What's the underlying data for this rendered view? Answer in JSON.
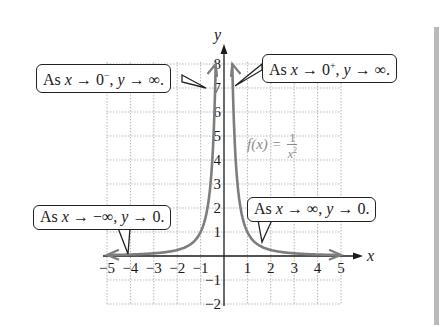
{
  "chart_data": {
    "type": "line",
    "title": "",
    "function": "f(x) = 1/x^2",
    "xlabel": "x",
    "ylabel": "y",
    "xlim": [
      -5,
      5
    ],
    "ylim": [
      -2,
      8
    ],
    "x_ticks": [
      -5,
      -4,
      -3,
      -2,
      -1,
      1,
      2,
      3,
      4,
      5
    ],
    "y_ticks": [
      -2,
      -1,
      1,
      2,
      3,
      4,
      5,
      6,
      7,
      8
    ],
    "grid": true,
    "series": [
      {
        "name": "f(x) = 1/x^2 (left branch)",
        "x": [
          -5,
          -4,
          -3,
          -2,
          -1.5,
          -1,
          -0.75,
          -0.5,
          -0.4,
          -0.354
        ],
        "y": [
          0.04,
          0.0625,
          0.111,
          0.25,
          0.444,
          1,
          1.778,
          4,
          6.25,
          8
        ]
      },
      {
        "name": "f(x) = 1/x^2 (right branch)",
        "x": [
          0.354,
          0.4,
          0.5,
          0.75,
          1,
          1.5,
          2,
          3,
          4,
          5
        ],
        "y": [
          8,
          6.25,
          4,
          1.778,
          1,
          0.444,
          0.25,
          0.111,
          0.0625,
          0.04
        ]
      }
    ],
    "annotations": [
      {
        "text": "As x → 0⁻, y → ∞.",
        "points_to": [
          -0.37,
          7.2
        ]
      },
      {
        "text": "As x → 0⁺, y → ∞.",
        "points_to": [
          0.37,
          7.2
        ]
      },
      {
        "text": "As x → −∞, y → 0.",
        "points_to": [
          -4,
          0.06
        ]
      },
      {
        "text": "As x → ∞, y → 0.",
        "points_to": [
          1.4,
          0.5
        ]
      },
      {
        "text": "f(x) = 1/x²",
        "position": [
          1.3,
          4
        ]
      }
    ]
  },
  "labels": {
    "x_axis": "x",
    "y_axis": "y",
    "func_name": "f(x) =",
    "func_num": "1",
    "func_den": "x",
    "func_exp": "2",
    "callout_left_top": {
      "pre": "As ",
      "var": "x",
      "mid": " → 0",
      "sup": "−",
      "post": ", ",
      "var2": "y",
      "end": " → ∞."
    },
    "callout_right_top": {
      "pre": "As ",
      "var": "x",
      "mid": " → 0",
      "sup": "+",
      "post": ", ",
      "var2": "y",
      "end": " → ∞."
    },
    "callout_left_bottom": {
      "pre": "As ",
      "var": "x",
      "mid": " → −∞, ",
      "var2": "y",
      "end": " → 0."
    },
    "callout_right_bottom": {
      "pre": "As ",
      "var": "x",
      "mid": " → ∞, ",
      "var2": "y",
      "end": " → 0."
    }
  },
  "colors": {
    "curve": "#7d7d7d",
    "axis": "#1a1a1a",
    "grid": "#b5b5b5",
    "func_label": "#8a8a8a",
    "side_bar": "#b9b9b9"
  }
}
